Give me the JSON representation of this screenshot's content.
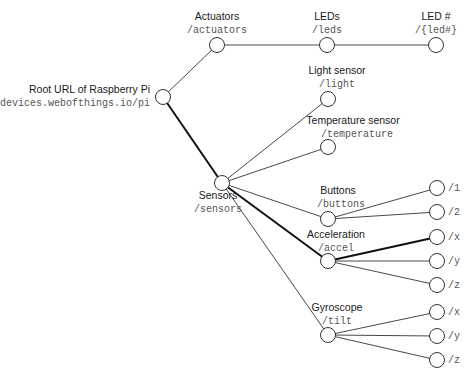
{
  "diagram": {
    "type": "tree",
    "nodes": [
      {
        "id": "root",
        "label": "Root URL of Raspberry Pi",
        "url": "devices.webofthings.io/pi",
        "x": 163,
        "y": 97
      },
      {
        "id": "actuators",
        "label": "Actuators",
        "url": "/actuators",
        "x": 217,
        "y": 45
      },
      {
        "id": "leds",
        "label": "LEDs",
        "url": "/leds",
        "x": 327,
        "y": 45
      },
      {
        "id": "led",
        "label": "LED #",
        "url": "/{led#}",
        "x": 436,
        "y": 45
      },
      {
        "id": "sensors",
        "label": "Sensors",
        "url": "/sensors",
        "x": 222,
        "y": 183
      },
      {
        "id": "light",
        "label": "Light sensor",
        "url": "/light",
        "x": 328,
        "y": 99
      },
      {
        "id": "temperature",
        "label": "Temperature sensor",
        "url": "/temperature",
        "x": 328,
        "y": 147
      },
      {
        "id": "buttons",
        "label": "Buttons",
        "url": "/buttons",
        "x": 328,
        "y": 219
      },
      {
        "id": "accel",
        "label": "Acceleration",
        "url": "/accel",
        "x": 328,
        "y": 261
      },
      {
        "id": "gyro",
        "label": "Gyroscope",
        "url": "/tilt",
        "x": 328,
        "y": 335
      },
      {
        "id": "b1",
        "label": "",
        "url": "/1",
        "x": 437,
        "y": 188
      },
      {
        "id": "b2",
        "label": "",
        "url": "/2",
        "x": 437,
        "y": 212
      },
      {
        "id": "ax",
        "label": "",
        "url": "/x",
        "x": 437,
        "y": 237
      },
      {
        "id": "ay",
        "label": "",
        "url": "/y",
        "x": 437,
        "y": 261
      },
      {
        "id": "az",
        "label": "",
        "url": "/z",
        "x": 437,
        "y": 285
      },
      {
        "id": "gx",
        "label": "",
        "url": "/x",
        "x": 437,
        "y": 312
      },
      {
        "id": "gy",
        "label": "",
        "url": "/y",
        "x": 437,
        "y": 336
      },
      {
        "id": "gz",
        "label": "",
        "url": "/z",
        "x": 437,
        "y": 360
      }
    ],
    "edges": [
      {
        "from": "root",
        "to": "actuators",
        "bold": false
      },
      {
        "from": "actuators",
        "to": "leds",
        "bold": false
      },
      {
        "from": "leds",
        "to": "led",
        "bold": false
      },
      {
        "from": "root",
        "to": "sensors",
        "bold": true
      },
      {
        "from": "sensors",
        "to": "light",
        "bold": false
      },
      {
        "from": "sensors",
        "to": "temperature",
        "bold": false
      },
      {
        "from": "sensors",
        "to": "buttons",
        "bold": false
      },
      {
        "from": "sensors",
        "to": "accel",
        "bold": true
      },
      {
        "from": "sensors",
        "to": "gyro",
        "bold": false
      },
      {
        "from": "buttons",
        "to": "b1",
        "bold": false
      },
      {
        "from": "buttons",
        "to": "b2",
        "bold": false
      },
      {
        "from": "accel",
        "to": "ax",
        "bold": true
      },
      {
        "from": "accel",
        "to": "ay",
        "bold": false
      },
      {
        "from": "accel",
        "to": "az",
        "bold": false
      },
      {
        "from": "gyro",
        "to": "gx",
        "bold": false
      },
      {
        "from": "gyro",
        "to": "gy",
        "bold": false
      },
      {
        "from": "gyro",
        "to": "gz",
        "bold": false
      }
    ]
  },
  "labels": {
    "root": {
      "title": "Root URL of Raspberry Pi",
      "url": "devices.webofthings.io/pi"
    },
    "actuators": {
      "title": "Actuators",
      "url": "/actuators"
    },
    "leds": {
      "title": "LEDs",
      "url": "/leds"
    },
    "led": {
      "title": "LED #",
      "url": "/{led#}"
    },
    "sensors": {
      "title": "Sensors",
      "url": "/sensors"
    },
    "light": {
      "title": "Light sensor",
      "url": "/light"
    },
    "temperature": {
      "title": "Temperature sensor",
      "url": "/temperature"
    },
    "buttons": {
      "title": "Buttons",
      "url": "/buttons"
    },
    "accel": {
      "title": "Acceleration",
      "url": "/accel"
    },
    "gyro": {
      "title": "Gyroscope",
      "url": "/tilt"
    },
    "leaves": {
      "b1": "/1",
      "b2": "/2",
      "ax": "/x",
      "ay": "/y",
      "az": "/z",
      "gx": "/x",
      "gy": "/y",
      "gz": "/z"
    }
  }
}
